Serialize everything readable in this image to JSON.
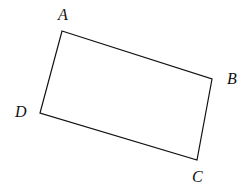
{
  "figure": {
    "kind": "geometry-diagram",
    "shape_name": "quadrilateral-ABCD",
    "canvas": {
      "width": 249,
      "height": 193
    },
    "background_color": "#ffffff",
    "stroke_color": "#111111",
    "stroke_width": 1.2,
    "fill": "none",
    "vertices": [
      {
        "name": "A",
        "x": 62,
        "y": 31,
        "label": "A",
        "label_x": 58,
        "label_y": 7
      },
      {
        "name": "B",
        "x": 212,
        "y": 79,
        "label": "B",
        "label_x": 227,
        "label_y": 71
      },
      {
        "name": "C",
        "x": 197,
        "y": 160,
        "label": "C",
        "label_x": 192,
        "label_y": 169
      },
      {
        "name": "D",
        "x": 40,
        "y": 113,
        "label": "D",
        "label_x": 15,
        "label_y": 104
      }
    ],
    "edges": [
      {
        "name": "edge-AB",
        "from": "A",
        "to": "B"
      },
      {
        "name": "edge-BC",
        "from": "B",
        "to": "C"
      },
      {
        "name": "edge-CD",
        "from": "C",
        "to": "D"
      },
      {
        "name": "edge-DA",
        "from": "D",
        "to": "A"
      }
    ],
    "path_d": "M 62 31 L 212 79 L 197 160 L 40 113 Z",
    "labels": {
      "A": "A",
      "B": "B",
      "C": "C",
      "D": "D"
    }
  }
}
